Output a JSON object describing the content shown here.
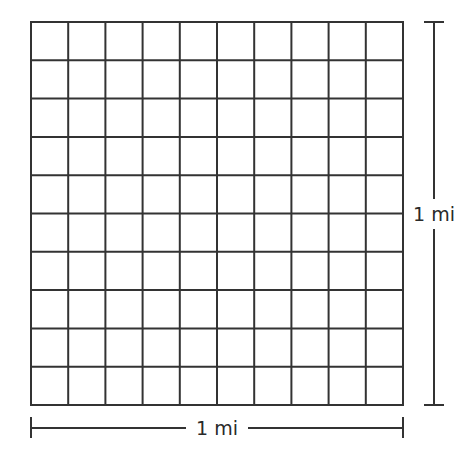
{
  "diagram": {
    "grid": {
      "rows": 10,
      "columns": 10,
      "left": 31,
      "top": 22,
      "right": 403,
      "bottom": 405,
      "line_color": "#333333",
      "line_width": 2
    },
    "dimensions": {
      "width_label": "1 mi",
      "height_label": "1 mi"
    },
    "colors": {
      "background": "#ffffff",
      "stroke": "#333333",
      "text": "#2a2a2a"
    }
  }
}
